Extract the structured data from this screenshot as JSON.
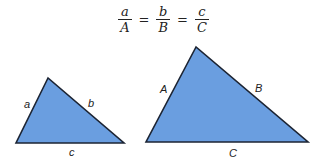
{
  "formula": {
    "fractions": [
      {
        "numerator": "a",
        "denominator": "A"
      },
      {
        "numerator": "b",
        "denominator": "B"
      },
      {
        "numerator": "c",
        "denominator": "C"
      }
    ],
    "equals": "="
  },
  "colors": {
    "triangle_fill": "#6a9ee0",
    "triangle_stroke": "#1c2433"
  },
  "small_triangle": {
    "labels": {
      "a": "a",
      "b": "b",
      "c": "c"
    }
  },
  "large_triangle": {
    "labels": {
      "A": "A",
      "B": "B",
      "C": "C"
    }
  }
}
